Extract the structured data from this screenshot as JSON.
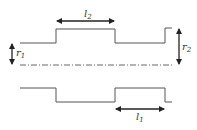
{
  "diagram": {
    "type": "stepped-shaft-profile",
    "line_color": "#555555",
    "labels": {
      "l1": {
        "main": "l",
        "sub": "1"
      },
      "l2": {
        "main": "l",
        "sub": "2"
      },
      "r1": {
        "main": "r",
        "sub": "1"
      },
      "r2": {
        "main": "r",
        "sub": "2"
      }
    },
    "centerline": "dash-dot axis"
  }
}
